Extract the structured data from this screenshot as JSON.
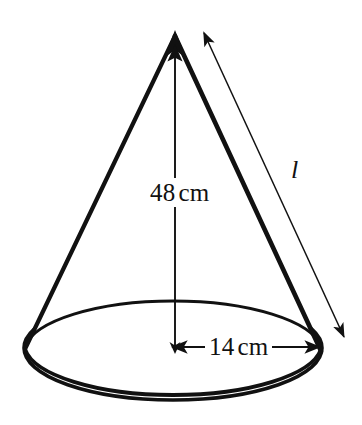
{
  "figure": {
    "name": "right-circular-cone-diagram",
    "background_color": "#ffffff",
    "stroke_color": "#111111"
  },
  "labels": {
    "height": {
      "value": "48",
      "unit": "cm",
      "text": "48 cm"
    },
    "radius": {
      "value": "14",
      "unit": "cm",
      "text": "14 cm"
    },
    "slant_height": {
      "text": "l"
    }
  },
  "shapes": {
    "apex": {
      "x": 175,
      "y": 33
    },
    "base_ellipse": {
      "cx": 173,
      "cy": 348,
      "rx": 149,
      "ry": 52
    },
    "height_arrow": {
      "x1": 175,
      "y1": 350,
      "x2": 175,
      "y2": 40
    },
    "radius_arrow": {
      "x1": 172,
      "y1": 347,
      "x2": 320,
      "y2": 347
    },
    "slant_arrow": {
      "x1": 203,
      "y1": 32,
      "x2": 345,
      "y2": 338
    }
  }
}
